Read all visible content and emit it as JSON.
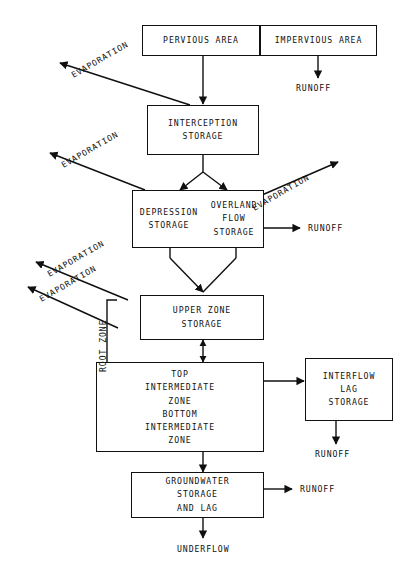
{
  "diagram": {
    "type": "flow-diagram",
    "ink_color": "#101010",
    "background_color": "#ffffff"
  },
  "boxes": {
    "pervious_area": {
      "label": "PERVIOUS AREA"
    },
    "impervious_area": {
      "label": "IMPERVIOUS AREA"
    },
    "interception_storage": {
      "line1": "INTERCEPTION",
      "line2": "STORAGE"
    },
    "depression_storage": {
      "line1": "DEPRESSION",
      "line2": "STORAGE"
    },
    "overland_flow_storage": {
      "line1": "OVERLAND",
      "line2": "FLOW",
      "line3": "STORAGE"
    },
    "upper_zone_storage": {
      "line1": "UPPER ZONE",
      "line2": "STORAGE"
    },
    "top_intermediate_zone": {
      "line1": "TOP",
      "line2": "INTERMEDIATE",
      "line3": "ZONE"
    },
    "bottom_intermediate_zone": {
      "line1": "BOTTOM",
      "line2": "INTERMEDIATE",
      "line3": "ZONE"
    },
    "interflow_lag_storage": {
      "line1": "INTERFLOW",
      "line2": "LAG",
      "line3": "STORAGE"
    },
    "groundwater_storage_and_lag": {
      "line1": "GROUNDWATER",
      "line2": "STORAGE",
      "line3": "AND LAG"
    }
  },
  "labels": {
    "evaporation_1": "EVAPORATION",
    "evaporation_2": "EVAPORATION",
    "evaporation_3": "EVAPORATION",
    "evaporation_4": "EVAPORATION",
    "evaporation_5": "EVAPORATION",
    "runoff_impervious": "RUNOFF",
    "runoff_overland": "RUNOFF",
    "runoff_interflow": "RUNOFF",
    "runoff_groundwater": "RUNOFF",
    "underflow": "UNDERFLOW",
    "root_zone": "ROOT ZONE"
  }
}
